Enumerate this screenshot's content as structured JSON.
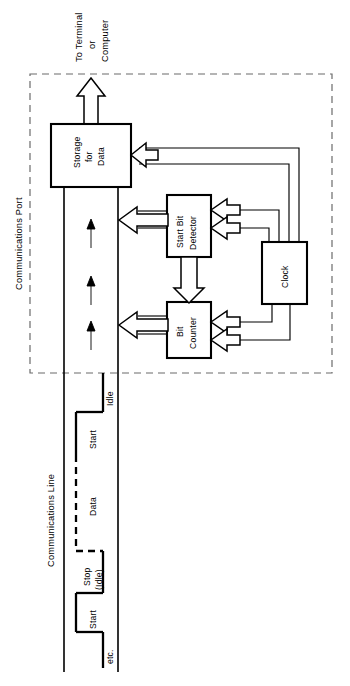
{
  "figure": {
    "width": 350,
    "height": 686,
    "background_color": "#ffffff",
    "line_color": "#000000",
    "dashed_boundary_color": "#6b6b6b"
  },
  "labels": {
    "destination_line1": "To Terminal",
    "destination_line2": "or",
    "destination_line3": "Computer",
    "boundary": "Communications Port",
    "comm_line": "Communications Line"
  },
  "blocks": [
    {
      "id": "storage",
      "line1": "Storage",
      "line2": "for",
      "line3": "Data"
    },
    {
      "id": "detector",
      "line1": "Start Bit",
      "line2": "Detector",
      "line3": ""
    },
    {
      "id": "clock",
      "line1": "Clock",
      "line2": "",
      "line3": ""
    },
    {
      "id": "counter",
      "line1": "Bit",
      "line2": "Counter",
      "line3": ""
    }
  ],
  "waveform": {
    "segments": [
      {
        "id": "idle-top",
        "label": "Idle",
        "label2": "",
        "style": "solid"
      },
      {
        "id": "start-1",
        "label": "Start",
        "label2": "",
        "style": "solid"
      },
      {
        "id": "data",
        "label": "Data",
        "label2": "",
        "style": "dashed"
      },
      {
        "id": "stop-idle",
        "label": "Stop",
        "label2": "(Idle)",
        "style": "solid"
      },
      {
        "id": "start-2",
        "label": "Start",
        "label2": "",
        "style": "solid"
      },
      {
        "id": "etc",
        "label": "etc.",
        "label2": "",
        "style": "solid"
      }
    ]
  }
}
